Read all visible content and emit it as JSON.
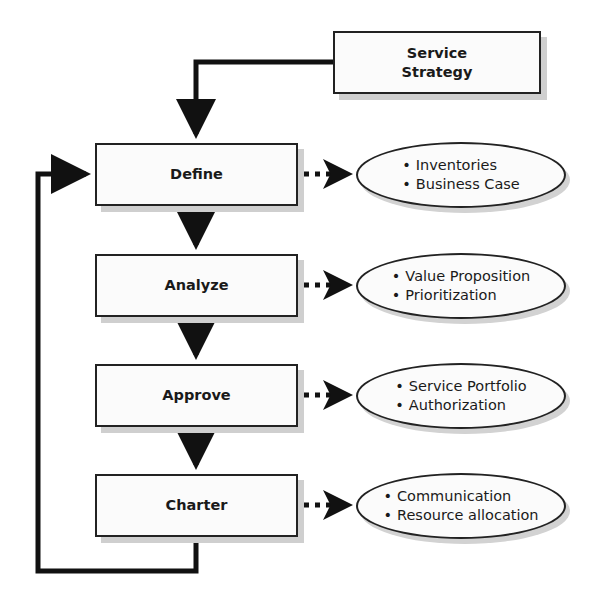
{
  "diagram": {
    "source": {
      "label": "Service Strategy",
      "line1": "Service",
      "line2": "Strategy"
    },
    "steps": [
      {
        "label": "Define",
        "outputs": [
          "Inventories",
          "Business Case"
        ]
      },
      {
        "label": "Analyze",
        "outputs": [
          "Value Proposition",
          "Prioritization"
        ]
      },
      {
        "label": "Approve",
        "outputs": [
          "Service Portfolio",
          "Authorization"
        ]
      },
      {
        "label": "Charter",
        "outputs": [
          "Communication",
          "Resource allocation"
        ]
      }
    ],
    "flow": {
      "source_to_first": "Service Strategy → Define",
      "sequence": "Define → Analyze → Approve → Charter",
      "feedback": "Charter → Define",
      "outputs_connector": "dotted arrow"
    },
    "colors": {
      "stroke": "#111111",
      "box_fill": "#fbfbfb",
      "shadow": "#cfcfcf"
    }
  }
}
